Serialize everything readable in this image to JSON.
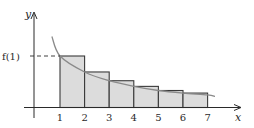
{
  "chart_data": {
    "type": "bar",
    "title": "",
    "xlabel": "x",
    "ylabel": "y",
    "annotations": [
      {
        "text": "f(1)",
        "target": "height of first rectangle",
        "style": "dashed leader line to y-axis"
      }
    ],
    "x_tick_labels": [
      "1",
      "2",
      "3",
      "4",
      "5",
      "6",
      "7"
    ],
    "bars": [
      {
        "x_start": 1,
        "x_end": 2,
        "height": 1.0
      },
      {
        "x_start": 2,
        "x_end": 3,
        "height": 0.69
      },
      {
        "x_start": 3,
        "x_end": 4,
        "height": 0.52
      },
      {
        "x_start": 4,
        "x_end": 5,
        "height": 0.41
      },
      {
        "x_start": 5,
        "x_end": 6,
        "height": 0.33
      },
      {
        "x_start": 6,
        "x_end": 7,
        "height": 0.28
      }
    ],
    "curve": {
      "name": "f(x)",
      "description": "decreasing curve passing through the upper-left corner of each rectangle",
      "x_range": [
        0.67,
        7.3
      ]
    },
    "xlim": [
      -1.05,
      7.4
    ],
    "ylim": [
      0,
      1.9
    ],
    "grid": false,
    "legend": null,
    "colors": {
      "bar_fill": "#dcdcdc",
      "bar_stroke": "#3a3a3a",
      "curve": "#8a8a8a",
      "axis": "#2a2a2a"
    }
  },
  "labels": {
    "y_axis": "y",
    "x_axis": "x",
    "f1": "f(1)"
  }
}
